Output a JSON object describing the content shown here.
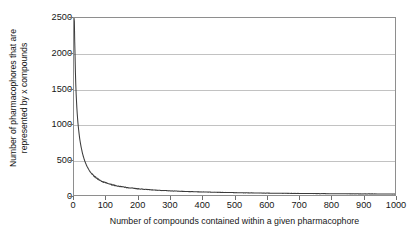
{
  "chart_data": {
    "type": "line",
    "title": "",
    "xlabel": "Number of compounds contained within a given pharmacophore",
    "ylabel": "Number of pharmacophores that are represented by x compounds",
    "ylabel_line1": "Number of pharmacophores that are",
    "ylabel_line2": "represented by x compounds",
    "xlim": [
      0,
      1000
    ],
    "ylim": [
      0,
      2500
    ],
    "xticks": [
      0,
      100,
      200,
      300,
      400,
      500,
      600,
      700,
      800,
      900,
      1000
    ],
    "xtick_labels": [
      "0",
      "100",
      "200",
      "300",
      "400",
      "500",
      "600",
      "700",
      "800",
      "900",
      "1000"
    ],
    "yticks": [
      0,
      500,
      1000,
      1500,
      2000,
      2500
    ],
    "ytick_labels": [
      "0",
      "500",
      "1000",
      "1500",
      "2000",
      "2500"
    ],
    "grid": "horizontal",
    "legend": "none",
    "series": [
      {
        "name": "pharmacophore frequency distribution",
        "color": "#3b3b3b",
        "x": [
          1,
          3,
          5,
          8,
          11,
          15,
          19,
          24,
          30,
          36,
          43,
          50,
          58,
          67,
          76,
          86,
          97,
          109,
          122,
          136,
          151,
          167,
          184,
          202,
          221,
          241,
          262,
          284,
          307,
          331,
          356,
          382,
          409,
          437,
          466,
          496,
          527,
          559,
          592,
          626,
          661,
          697,
          734,
          772,
          811,
          851,
          892,
          934,
          977,
          1000
        ],
        "values": [
          2500,
          2050,
          1640,
          1310,
          1090,
          900,
          760,
          640,
          530,
          452,
          384,
          330,
          288,
          250,
          222,
          196,
          175,
          157,
          141,
          127,
          115,
          104,
          95,
          87,
          80,
          73,
          67,
          62,
          57,
          53,
          49,
          45,
          42,
          39,
          36,
          34,
          31,
          29,
          27,
          25,
          24,
          22,
          21,
          19,
          18,
          17,
          16,
          15,
          14,
          13
        ]
      }
    ]
  },
  "figure": {
    "background_color": "#ffffff",
    "frame_color": "#8e8e8e",
    "grid_color": "#c2c2c2",
    "curve_color": "#3b3b3b"
  }
}
